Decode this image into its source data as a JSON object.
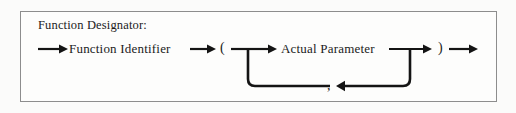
{
  "diagram": {
    "kind": "railroad-syntax-diagram",
    "title": "Function Designator:",
    "nodes": {
      "function_identifier": "Function Identifier",
      "left_paren": "(",
      "actual_parameter": "Actual Parameter",
      "right_paren": ")",
      "comma": ","
    },
    "colors": {
      "frame_border": "#8d8d8d",
      "line": "#141414",
      "text": "#1b1b1b",
      "page_background": "#fbfbfa",
      "frame_background": "#fdfdfc"
    },
    "arrows": {
      "entry": "right",
      "after_function_identifier": "right",
      "into_actual_parameter": "right",
      "after_actual_parameter": "right",
      "exit": "right",
      "loop_back": "left"
    },
    "flow_sequence": [
      "Function Identifier",
      "(",
      "Actual Parameter",
      ")"
    ],
    "loop_description": "Actual Parameter may repeat, separated by ,"
  }
}
